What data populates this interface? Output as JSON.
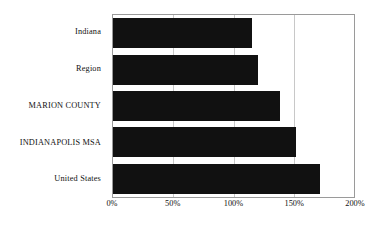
{
  "chart_data": {
    "type": "bar",
    "orientation": "horizontal",
    "title": "",
    "subtitle": "",
    "xlabel": "",
    "ylabel": "",
    "categories": [
      "Indiana",
      "Region",
      "MARION COUNTY",
      "INDIANAPOLIS MSA",
      "United States"
    ],
    "values": [
      115,
      120,
      139,
      152,
      172
    ],
    "value_unit": "%",
    "xlim": [
      0,
      200
    ],
    "xticks": [
      0,
      50,
      100,
      150,
      200
    ],
    "xtick_labels": [
      "0%",
      "50%",
      "100%",
      "150%",
      "200%"
    ],
    "grid": true,
    "grid_axis": "x",
    "legend": false,
    "bar_color": "#111111",
    "plot_border_color": "#9a9a9a",
    "gridline_color": "#c8c8c8",
    "background_color": "#ffffff",
    "series": [
      {
        "name": "Value",
        "points": [
          {
            "category": "Indiana",
            "value": 115
          },
          {
            "category": "Region",
            "value": 120
          },
          {
            "category": "MARION COUNTY",
            "value": 139
          },
          {
            "category": "INDIANAPOLIS MSA",
            "value": 152
          },
          {
            "category": "United States",
            "value": 172
          }
        ]
      }
    ]
  }
}
